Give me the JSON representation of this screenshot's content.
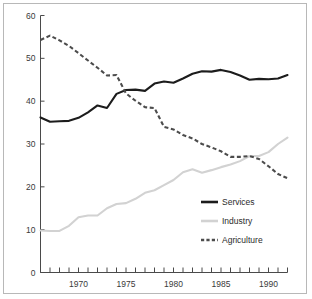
{
  "chart_data": {
    "type": "line",
    "title": "",
    "subtitle": "",
    "xlabel": "",
    "ylabel": "",
    "xlim": [
      1966,
      1992
    ],
    "ylim": [
      0,
      60
    ],
    "yticks": [
      0,
      10,
      20,
      30,
      40,
      50,
      60
    ],
    "ytick_labels": [
      "0",
      "10",
      "20",
      "30",
      "40",
      "50",
      "60"
    ],
    "xticks": [
      1966,
      1967,
      1968,
      1969,
      1970,
      1971,
      1972,
      1973,
      1974,
      1975,
      1976,
      1977,
      1978,
      1979,
      1980,
      1981,
      1982,
      1983,
      1984,
      1985,
      1986,
      1987,
      1988,
      1989,
      1990,
      1991,
      1992
    ],
    "xtick_labels_shown": [
      "1970",
      "1975",
      "1980",
      "1985",
      "1990"
    ],
    "xtick_label_years": [
      1970,
      1975,
      1980,
      1985,
      1990
    ],
    "grid": false,
    "legend_position": "center-right",
    "x": [
      1966,
      1967,
      1968,
      1969,
      1970,
      1971,
      1972,
      1973,
      1974,
      1975,
      1976,
      1977,
      1978,
      1979,
      1980,
      1981,
      1982,
      1983,
      1984,
      1985,
      1986,
      1987,
      1988,
      1989,
      1990,
      1991,
      1992
    ],
    "series": [
      {
        "name": "Services",
        "color": "#1c1c1c",
        "style": "solid",
        "values": [
          36.2,
          35.2,
          35.3,
          35.4,
          36.1,
          37.4,
          39.0,
          38.4,
          41.7,
          42.6,
          42.7,
          42.4,
          44.1,
          44.6,
          44.3,
          45.3,
          46.4,
          47.0,
          46.9,
          47.3,
          46.8,
          46.0,
          45.0,
          45.2,
          45.1,
          45.3,
          46.1
        ]
      },
      {
        "name": "Industry",
        "color": "#d2d2d2",
        "style": "solid",
        "values": [
          9.8,
          9.7,
          9.7,
          10.9,
          12.9,
          13.3,
          13.3,
          15.0,
          16.0,
          16.2,
          17.2,
          18.6,
          19.2,
          20.4,
          21.6,
          23.4,
          24.1,
          23.3,
          23.9,
          24.6,
          25.2,
          26.0,
          27.2,
          27.2,
          28.1,
          30.0,
          31.5
        ]
      },
      {
        "name": "Agriculture",
        "color": "#4c4c4c",
        "style": "dashed",
        "values": [
          54.3,
          55.3,
          54.2,
          52.9,
          51.2,
          49.5,
          47.8,
          46.0,
          46.1,
          41.8,
          40.1,
          38.6,
          38.4,
          34.0,
          33.4,
          32.1,
          31.3,
          30.0,
          29.2,
          28.3,
          27.0,
          27.0,
          27.2,
          26.5,
          24.8,
          23.0,
          22.0
        ]
      }
    ],
    "legend": [
      {
        "label": "Services",
        "color": "#1c1c1c",
        "style": "solid"
      },
      {
        "label": "Industry",
        "color": "#d2d2d2",
        "style": "solid"
      },
      {
        "label": "Agriculture",
        "color": "#4c4c4c",
        "style": "dashed"
      }
    ]
  }
}
